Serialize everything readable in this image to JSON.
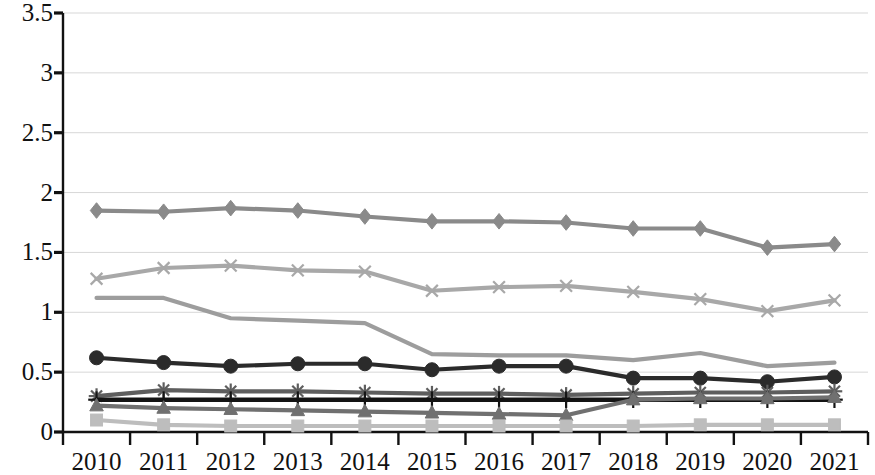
{
  "chart_data": {
    "type": "line",
    "title": "",
    "subtitle": "",
    "xlabel": "",
    "ylabel": "",
    "categories": [
      "2010",
      "2011",
      "2012",
      "2013",
      "2014",
      "2015",
      "2016",
      "2017",
      "2018",
      "2019",
      "2020",
      "2021"
    ],
    "x": [
      2010,
      2011,
      2012,
      2013,
      2014,
      2015,
      2016,
      2017,
      2018,
      2019,
      2020,
      2021
    ],
    "ylim": [
      0,
      3.5
    ],
    "ytick_labels": [
      "0",
      "0.5",
      "1",
      "1.5",
      "2",
      "2.5",
      "3",
      "3.5"
    ],
    "ytick_values": [
      0,
      0.5,
      1,
      1.5,
      2,
      2.5,
      3,
      3.5
    ],
    "grid": true,
    "grid_axis": "y",
    "legend": "none",
    "legend_position": "none",
    "series": [
      {
        "name": "Series 1",
        "marker": "diamond",
        "color": "#8a8a8a",
        "values": [
          1.85,
          1.84,
          1.87,
          1.85,
          1.8,
          1.76,
          1.76,
          1.75,
          1.7,
          1.7,
          1.54,
          1.57
        ]
      },
      {
        "name": "Series 2",
        "marker": "x",
        "color": "#a8a8a8",
        "values": [
          1.28,
          1.37,
          1.39,
          1.35,
          1.34,
          1.18,
          1.21,
          1.22,
          1.17,
          1.11,
          1.01,
          1.1
        ]
      },
      {
        "name": "Series 3",
        "marker": "none",
        "color": "#9d9d9d",
        "values": [
          1.12,
          1.12,
          0.95,
          0.93,
          0.91,
          0.65,
          0.64,
          0.64,
          0.6,
          0.66,
          0.55,
          0.58
        ]
      },
      {
        "name": "Series 4",
        "marker": "circle",
        "color": "#2b2b2b",
        "values": [
          0.62,
          0.58,
          0.55,
          0.57,
          0.57,
          0.52,
          0.55,
          0.55,
          0.45,
          0.45,
          0.42,
          0.46
        ]
      },
      {
        "name": "Series 5",
        "marker": "asterisk",
        "color": "#5e5e5e",
        "values": [
          0.3,
          0.35,
          0.34,
          0.34,
          0.33,
          0.32,
          0.32,
          0.31,
          0.32,
          0.33,
          0.33,
          0.34
        ]
      },
      {
        "name": "Series 6",
        "marker": "plus",
        "color": "#141414",
        "values": [
          0.27,
          0.27,
          0.27,
          0.27,
          0.27,
          0.27,
          0.27,
          0.27,
          0.27,
          0.27,
          0.27,
          0.27
        ]
      },
      {
        "name": "Series 7",
        "marker": "triangle",
        "color": "#707070",
        "values": [
          0.22,
          0.2,
          0.19,
          0.18,
          0.17,
          0.16,
          0.15,
          0.14,
          0.27,
          0.28,
          0.28,
          0.29
        ]
      },
      {
        "name": "Series 8",
        "marker": "square",
        "color": "#bdbdbd",
        "values": [
          0.1,
          0.06,
          0.05,
          0.05,
          0.05,
          0.05,
          0.05,
          0.05,
          0.05,
          0.06,
          0.06,
          0.06
        ]
      }
    ]
  },
  "axes": {
    "y_axis_name": "value-axis",
    "x_axis_name": "year-axis"
  }
}
